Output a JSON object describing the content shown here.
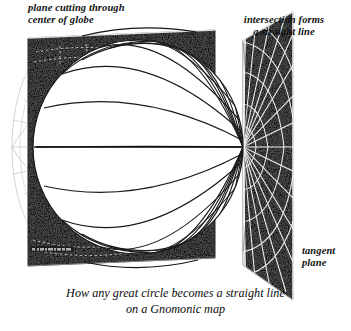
{
  "figure": {
    "title_caption": "How any great circle becomes a straight line\non a Gnomonic map",
    "background_color": "#ffffff",
    "ink_color": "#121212",
    "plane_fill_color": "#111111",
    "globe_fill_color": "#ffffff",
    "grid_line_color": "#1a1a1a",
    "projection_line_color": "#f2f2f2"
  },
  "labels": {
    "plane_cutting": "plane cutting through\ncenter of globe",
    "intersection": "intersection forms\na straight line",
    "tangent": "tangent\nplane"
  },
  "diagram": {
    "globe": {
      "name": "globe",
      "center_x": 138,
      "center_y": 147,
      "radius_x": 105,
      "radius_y": 107,
      "meridian_count": 9,
      "parallel_count": 7,
      "pole_x": 243,
      "pole_y": 147
    },
    "cutting_plane": {
      "name": "cutting-plane",
      "corners": "28,38 215,30 215,258 28,266"
    },
    "tangent_plane": {
      "name": "tangent-plane",
      "corners": "243,40 293,12 293,300 243,265",
      "radial_line_count": 16,
      "arc_count": 4
    },
    "ghost_arc": {
      "name": "back-of-globe-arc",
      "center_x": 60,
      "center_y": 147,
      "radius_x": 48,
      "radius_y": 103
    },
    "signature": {
      "name": "artist-signature",
      "x": 30,
      "y": 247,
      "legible": "no"
    }
  }
}
